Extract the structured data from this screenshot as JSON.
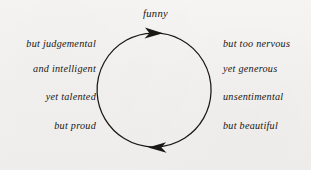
{
  "diagram": {
    "type": "circular-cycle",
    "top_label": "funny",
    "circle": {
      "center_x": 154,
      "center_y": 90,
      "radius": 57,
      "direction": "clockwise",
      "stroke_color": "#1a1815"
    },
    "arrowheads": [
      {
        "name": "top-arrowhead",
        "position": "top",
        "points": "right"
      },
      {
        "name": "bottom-arrowhead",
        "position": "bottom",
        "points": "left"
      }
    ],
    "left_column": [
      "but judgemental",
      "and intelligent",
      "yet talented",
      "but proud"
    ],
    "right_column": [
      "but too nervous",
      "yet generous",
      "unsentimental",
      "but beautiful"
    ]
  },
  "colors": {
    "ink": "#191715",
    "background": "#f4f3f1"
  }
}
